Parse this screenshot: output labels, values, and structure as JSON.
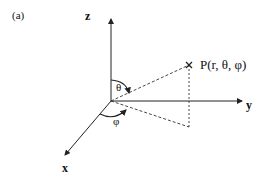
{
  "panel_label": "(a)",
  "axes": {
    "x": "x",
    "y": "y",
    "z": "z"
  },
  "point": {
    "label": "P(r, θ, φ)"
  },
  "angles": {
    "polar": "θ",
    "azimuthal": "φ"
  },
  "colors": {
    "line": "#222222",
    "background": "#ffffff"
  }
}
